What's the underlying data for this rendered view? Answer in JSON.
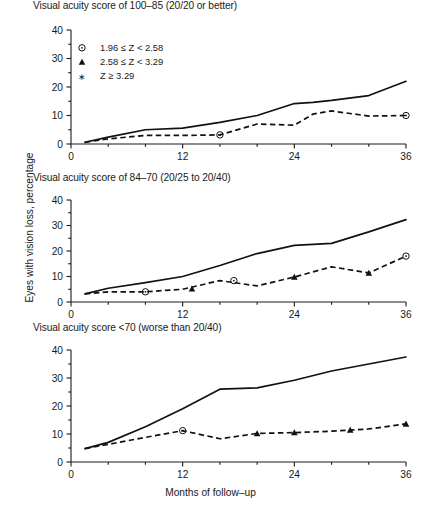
{
  "figure": {
    "y_axis_label": "Eyes with vision loss, percentage",
    "x_axis_label": "Months of follow–up"
  },
  "legend": {
    "items": [
      {
        "marker": "circle-dot-icon",
        "label": "1.96 ≤ Z < 2.58"
      },
      {
        "marker": "triangle-up-icon",
        "label": "2.58 ≤ Z < 3.29"
      },
      {
        "marker": "star-icon",
        "label": "Z ≥ 3.29"
      }
    ]
  },
  "axis": {
    "y_ticks": [
      "0",
      "10",
      "20",
      "30",
      "40"
    ],
    "x_ticks": [
      "0",
      "12",
      "24",
      "36"
    ]
  },
  "panels": [
    {
      "title": "Visual acuity score of 100–85 (20/20 or better)"
    },
    {
      "title": "Visual acuity score of 84–70 (20/25 to 20/40)"
    },
    {
      "title": "Visual acuity score <70 (worse than 20/40)"
    }
  ],
  "chart_data": {
    "type": "line",
    "xlabel": "Months of follow–up",
    "ylabel": "Eyes with vision loss, percentage",
    "xlim": [
      0,
      36
    ],
    "ylim": [
      0,
      40
    ],
    "x_ticks": [
      0,
      12,
      24,
      36
    ],
    "x_minor_tick_step": 4,
    "y_ticks": [
      0,
      10,
      20,
      30,
      40
    ],
    "y_minor_tick_step": 5,
    "grid": false,
    "legend_position": "upper-left-panel-1",
    "legend_entries": [
      "1.96 ≤ Z < 2.58",
      "2.58 ≤ Z < 3.29",
      "Z ≥ 3.29"
    ],
    "panels": [
      {
        "title": "Visual acuity score of 100–85 (20/20 or better)",
        "series": [
          {
            "name": "solid",
            "style": "solid",
            "x": [
              1.5,
              4,
              8,
              12,
              16,
              20,
              24,
              26,
              28,
              32,
              36
            ],
            "values": [
              0.6,
              2.4,
              5.0,
              5.6,
              7.6,
              10.0,
              14.2,
              14.6,
              15.3,
              17.0,
              22.0
            ]
          },
          {
            "name": "dashed",
            "style": "dashed",
            "x": [
              1.5,
              4,
              8,
              12,
              16,
              20,
              24,
              26,
              28,
              32,
              36
            ],
            "values": [
              0.6,
              1.8,
              3.0,
              3.0,
              3.2,
              7.0,
              6.6,
              10.5,
              11.6,
              9.8,
              10.0
            ]
          }
        ],
        "markers": [
          {
            "x": 16,
            "y": 3.2,
            "type": "circle-dot"
          },
          {
            "x": 36,
            "y": 10.0,
            "type": "circle-dot"
          }
        ]
      },
      {
        "title": "Visual acuity score of 84–70 (20/25 to 20/40)",
        "series": [
          {
            "name": "solid",
            "style": "solid",
            "x": [
              1.5,
              4,
              8,
              12,
              16,
              20,
              24,
              28,
              32,
              36
            ],
            "values": [
              3.2,
              5.4,
              7.6,
              10.0,
              14.3,
              19.0,
              22.2,
              23.0,
              27.5,
              32.3
            ]
          },
          {
            "name": "dashed",
            "style": "dashed",
            "x": [
              1.5,
              4,
              8,
              12,
              16,
              20,
              24,
              28,
              32,
              36
            ],
            "values": [
              3.2,
              4.0,
              4.0,
              5.0,
              8.4,
              6.3,
              9.8,
              13.8,
              11.4,
              18.0
            ]
          }
        ],
        "markers": [
          {
            "x": 8,
            "y": 4.0,
            "type": "circle-dot"
          },
          {
            "x": 13,
            "y": 5.2,
            "type": "triangle-up"
          },
          {
            "x": 17.5,
            "y": 8.4,
            "type": "circle-dot"
          },
          {
            "x": 24,
            "y": 9.8,
            "type": "triangle-up"
          },
          {
            "x": 32,
            "y": 11.4,
            "type": "triangle-up"
          },
          {
            "x": 36,
            "y": 18.0,
            "type": "circle-dot"
          }
        ]
      },
      {
        "title": "Visual acuity score <70 (worse than 20/40)",
        "series": [
          {
            "name": "solid",
            "style": "solid",
            "x": [
              1.5,
              4,
              8,
              12,
              16,
              20,
              24,
              28,
              32,
              36
            ],
            "values": [
              4.8,
              7.0,
              12.6,
              19.0,
              26.0,
              26.5,
              29.2,
              32.5,
              35.0,
              37.5
            ]
          },
          {
            "name": "dashed",
            "style": "dashed",
            "x": [
              1.5,
              4,
              8,
              12,
              16,
              20,
              24,
              28,
              32,
              36
            ],
            "values": [
              4.8,
              6.3,
              8.8,
              11.2,
              8.3,
              10.2,
              10.5,
              11.0,
              11.8,
              13.6
            ]
          }
        ],
        "markers": [
          {
            "x": 12,
            "y": 11.2,
            "type": "circle-dot"
          },
          {
            "x": 20,
            "y": 10.2,
            "type": "triangle-up"
          },
          {
            "x": 24,
            "y": 10.5,
            "type": "triangle-up"
          },
          {
            "x": 30,
            "y": 11.4,
            "type": "triangle-up"
          },
          {
            "x": 36,
            "y": 13.6,
            "type": "triangle-up"
          }
        ]
      }
    ]
  }
}
